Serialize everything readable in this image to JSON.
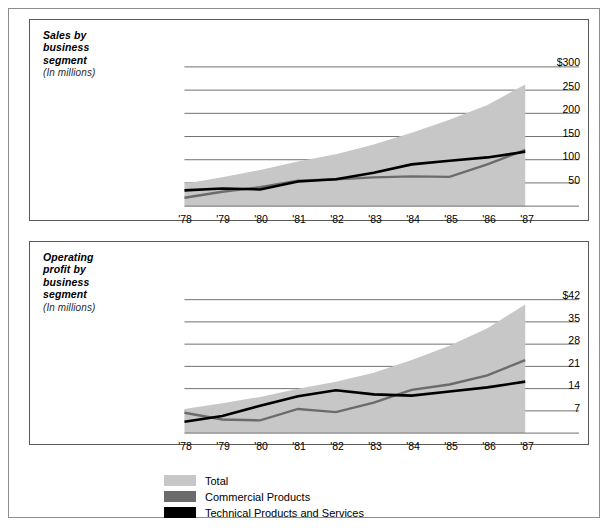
{
  "legend": {
    "items": [
      {
        "label": "Total",
        "color": "#c7c7c7"
      },
      {
        "label": "Commercial Products",
        "color": "#6b6b6b"
      },
      {
        "label": "Technical Products and Services",
        "color": "#000000"
      }
    ]
  },
  "charts": [
    {
      "key": "sales",
      "title": "Sales by business segment",
      "title_lines": [
        "Sales by",
        "business",
        "segment"
      ],
      "subtitle": "(In millions)",
      "units": "millions"
    },
    {
      "key": "profit",
      "title": "Operating profit by business segment",
      "title_lines": [
        "Operating",
        "profit by",
        "business",
        "segment"
      ],
      "subtitle": "(In millions)",
      "units": "millions"
    }
  ],
  "chart_data": [
    {
      "type": "area",
      "key": "sales",
      "title": "Sales by business segment",
      "subtitle": "(In millions)",
      "xlabel": "",
      "ylabel": "",
      "categories": [
        "'78",
        "'79",
        "'80",
        "'81",
        "'82",
        "'83",
        "'84",
        "'85",
        "'86",
        "'87"
      ],
      "ytick_labels": [
        "$300",
        "250",
        "200",
        "150",
        "100",
        "50"
      ],
      "ytick_values": [
        300,
        250,
        200,
        150,
        100,
        50
      ],
      "ylim": [
        0,
        320
      ],
      "grid": true,
      "legend_position": "bottom",
      "series": [
        {
          "name": "Total",
          "kind": "area",
          "color": "#c7c7c7",
          "values": [
            48,
            62,
            78,
            96,
            112,
            133,
            158,
            186,
            218,
            262
          ]
        },
        {
          "name": "Commercial Products",
          "kind": "line",
          "color": "#6b6b6b",
          "values": [
            18,
            31,
            41,
            55,
            58,
            62,
            64,
            63,
            90,
            121
          ]
        },
        {
          "name": "Technical Products and Services",
          "kind": "line",
          "color": "#000000",
          "values": [
            34,
            38,
            36,
            53,
            58,
            72,
            90,
            98,
            105,
            117
          ]
        }
      ]
    },
    {
      "type": "area",
      "key": "profit",
      "title": "Operating profit by business segment",
      "subtitle": "(In millions)",
      "xlabel": "",
      "ylabel": "",
      "categories": [
        "'78",
        "'79",
        "'80",
        "'81",
        "'82",
        "'83",
        "'84",
        "'85",
        "'86",
        "'87"
      ],
      "ytick_labels": [
        "$42",
        "35",
        "28",
        "21",
        "14",
        "7"
      ],
      "ytick_values": [
        42,
        35,
        28,
        21,
        14,
        7
      ],
      "ylim": [
        0,
        45.5
      ],
      "grid": true,
      "legend_position": "bottom",
      "series": [
        {
          "name": "Total",
          "kind": "area",
          "color": "#c7c7c7",
          "values": [
            7.6,
            9.4,
            11.4,
            14.0,
            16.2,
            19.0,
            23.0,
            27.5,
            33.0,
            40.5
          ]
        },
        {
          "name": "Commercial Products",
          "kind": "line",
          "color": "#6b6b6b",
          "values": [
            6.4,
            4.3,
            4.0,
            7.6,
            6.6,
            9.6,
            13.6,
            15.3,
            18.2,
            23.0
          ]
        },
        {
          "name": "Technical Products and Services",
          "kind": "line",
          "color": "#000000",
          "values": [
            3.6,
            5.4,
            8.6,
            11.6,
            13.5,
            12.2,
            11.8,
            13.1,
            14.4,
            16.2
          ]
        }
      ]
    }
  ]
}
